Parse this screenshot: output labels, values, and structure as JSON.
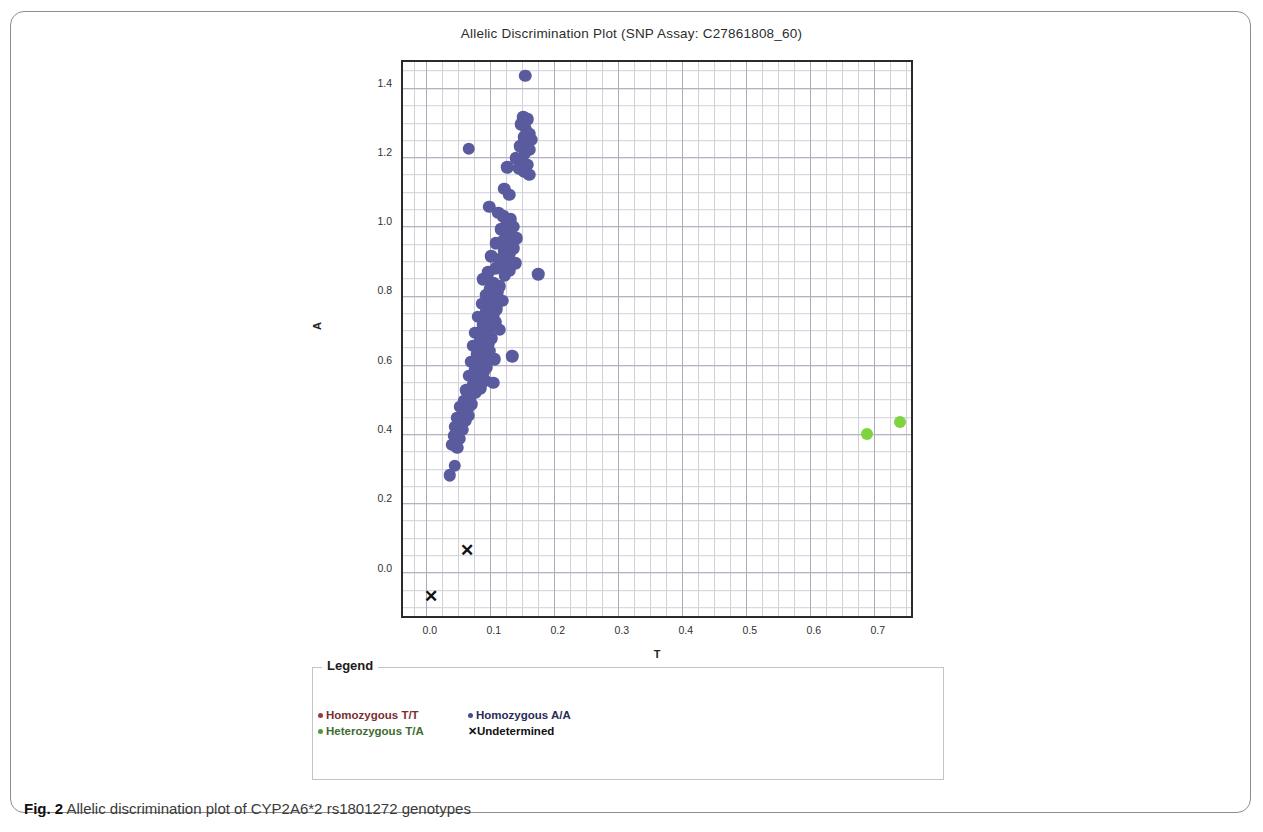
{
  "figure": {
    "caption_label": "Fig. 2",
    "caption_text": " Allelic discrimination plot of CYP2A6*2 rs1801272 genotypes"
  },
  "chart_data": {
    "type": "scatter",
    "title": "Allelic Discrimination Plot (SNP Assay: C27861808_60)",
    "xlabel": "T",
    "ylabel": "A",
    "xlim": [
      -0.045,
      0.755
    ],
    "ylim": [
      -0.145,
      1.465
    ],
    "xticks": [
      "0.0",
      "0.1",
      "0.2",
      "0.3",
      "0.4",
      "0.5",
      "0.6",
      "0.7"
    ],
    "xtick_values": [
      0.0,
      0.1,
      0.2,
      0.3,
      0.4,
      0.5,
      0.6,
      0.7
    ],
    "yticks": [
      "0.0",
      "0.2",
      "0.4",
      "0.6",
      "0.8",
      "1.0",
      "1.2",
      "1.4"
    ],
    "ytick_values": [
      0.0,
      0.2,
      0.4,
      0.6,
      0.8,
      1.0,
      1.2,
      1.4
    ],
    "grid": true,
    "grid_minor": true,
    "legend_position": "below-plot",
    "series": [
      {
        "name": "Homozygous A/A",
        "marker": "circle",
        "color": "#5a5a9e",
        "points": [
          [
            0.146,
            1.425
          ],
          [
            0.143,
            1.305
          ],
          [
            0.15,
            1.3
          ],
          [
            0.139,
            1.285
          ],
          [
            0.147,
            1.272
          ],
          [
            0.152,
            1.258
          ],
          [
            0.144,
            1.248
          ],
          [
            0.156,
            1.24
          ],
          [
            0.149,
            1.228
          ],
          [
            0.138,
            1.222
          ],
          [
            0.152,
            1.212
          ],
          [
            0.145,
            1.2
          ],
          [
            0.058,
            1.215
          ],
          [
            0.131,
            1.188
          ],
          [
            0.142,
            1.178
          ],
          [
            0.149,
            1.168
          ],
          [
            0.136,
            1.158
          ],
          [
            0.118,
            1.162
          ],
          [
            0.144,
            1.148
          ],
          [
            0.152,
            1.14
          ],
          [
            0.113,
            1.1
          ],
          [
            0.121,
            1.082
          ],
          [
            0.09,
            1.048
          ],
          [
            0.104,
            1.03
          ],
          [
            0.112,
            1.02
          ],
          [
            0.123,
            1.012
          ],
          [
            0.118,
            0.998
          ],
          [
            0.128,
            0.99
          ],
          [
            0.108,
            0.982
          ],
          [
            0.116,
            0.972
          ],
          [
            0.125,
            0.962
          ],
          [
            0.133,
            0.956
          ],
          [
            0.111,
            0.948
          ],
          [
            0.12,
            0.938
          ],
          [
            0.1,
            0.942
          ],
          [
            0.128,
            0.928
          ],
          [
            0.113,
            0.92
          ],
          [
            0.122,
            0.912
          ],
          [
            0.093,
            0.905
          ],
          [
            0.106,
            0.898
          ],
          [
            0.118,
            0.89
          ],
          [
            0.13,
            0.884
          ],
          [
            0.111,
            0.876
          ],
          [
            0.1,
            0.87
          ],
          [
            0.121,
            0.862
          ],
          [
            0.088,
            0.858
          ],
          [
            0.114,
            0.85
          ],
          [
            0.166,
            0.852
          ],
          [
            0.08,
            0.838
          ],
          [
            0.096,
            0.828
          ],
          [
            0.106,
            0.818
          ],
          [
            0.091,
            0.81
          ],
          [
            0.102,
            0.8
          ],
          [
            0.085,
            0.792
          ],
          [
            0.098,
            0.782
          ],
          [
            0.11,
            0.776
          ],
          [
            0.078,
            0.768
          ],
          [
            0.09,
            0.76
          ],
          [
            0.101,
            0.752
          ],
          [
            0.084,
            0.744
          ],
          [
            0.096,
            0.736
          ],
          [
            0.072,
            0.73
          ],
          [
            0.088,
            0.722
          ],
          [
            0.1,
            0.714
          ],
          [
            0.08,
            0.706
          ],
          [
            0.092,
            0.698
          ],
          [
            0.106,
            0.692
          ],
          [
            0.068,
            0.684
          ],
          [
            0.082,
            0.676
          ],
          [
            0.094,
            0.668
          ],
          [
            0.076,
            0.66
          ],
          [
            0.088,
            0.652
          ],
          [
            0.064,
            0.646
          ],
          [
            0.078,
            0.638
          ],
          [
            0.09,
            0.63
          ],
          [
            0.07,
            0.622
          ],
          [
            0.084,
            0.614
          ],
          [
            0.098,
            0.608
          ],
          [
            0.126,
            0.616
          ],
          [
            0.062,
            0.6
          ],
          [
            0.075,
            0.592
          ],
          [
            0.086,
            0.584
          ],
          [
            0.068,
            0.576
          ],
          [
            0.08,
            0.568
          ],
          [
            0.058,
            0.56
          ],
          [
            0.072,
            0.552
          ],
          [
            0.084,
            0.546
          ],
          [
            0.096,
            0.54
          ],
          [
            0.064,
            0.532
          ],
          [
            0.076,
            0.524
          ],
          [
            0.054,
            0.518
          ],
          [
            0.068,
            0.51
          ],
          [
            0.06,
            0.5
          ],
          [
            0.05,
            0.486
          ],
          [
            0.062,
            0.478
          ],
          [
            0.044,
            0.47
          ],
          [
            0.056,
            0.462
          ],
          [
            0.048,
            0.452
          ],
          [
            0.058,
            0.444
          ],
          [
            0.04,
            0.438
          ],
          [
            0.052,
            0.43
          ],
          [
            0.046,
            0.42
          ],
          [
            0.036,
            0.412
          ],
          [
            0.048,
            0.404
          ],
          [
            0.042,
            0.396
          ],
          [
            0.034,
            0.386
          ],
          [
            0.044,
            0.378
          ],
          [
            0.032,
            0.36
          ],
          [
            0.04,
            0.352
          ],
          [
            0.036,
            0.3
          ],
          [
            0.028,
            0.272
          ]
        ]
      },
      {
        "name": "Heterozygous T/A",
        "marker": "circle",
        "color": "#7ed33f",
        "points": [
          [
            0.68,
            0.392
          ],
          [
            0.732,
            0.425
          ]
        ]
      },
      {
        "name": "Homozygous T/T",
        "marker": "circle",
        "color": "#a03636",
        "points": []
      },
      {
        "name": "Undetermined",
        "marker": "x",
        "color": "#111111",
        "points": [
          [
            0.055,
            0.057
          ],
          [
            -0.001,
            -0.075
          ]
        ]
      }
    ]
  },
  "legend": {
    "title": "Legend",
    "rows": [
      [
        {
          "label": "Homozygous T/T",
          "marker": "circle",
          "swatch_color": "#a03636",
          "text_color": "#7a2f2f"
        },
        {
          "label": "Homozygous A/A",
          "marker": "circle",
          "swatch_color": "#4a4a8c",
          "text_color": "#2b2b55"
        }
      ],
      [
        {
          "label": "Heterozygous T/A",
          "marker": "circle",
          "swatch_color": "#4f9a38",
          "text_color": "#3e6b30"
        },
        {
          "label": "Undetermined",
          "marker": "x",
          "swatch_color": "#111111",
          "text_color": "#111111"
        }
      ]
    ]
  }
}
